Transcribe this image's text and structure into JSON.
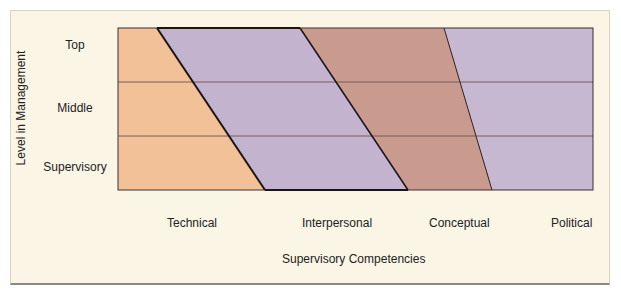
{
  "diagram": {
    "y_axis_label": "Level in Management",
    "x_axis_label": "Supervisory Competencies",
    "levels": [
      "Top",
      "Middle",
      "Supervisory"
    ],
    "competencies": [
      "Technical",
      "Interpersonal",
      "Conceptual",
      "Political"
    ],
    "colors": {
      "background": "#fbf5e6",
      "technical": "#f2c197",
      "interpersonal": "#c4b3cf",
      "conceptual": "#c99a8e",
      "political": "#c7b8d2",
      "lines": "#2a2222"
    },
    "bands": [
      {
        "name": "Technical",
        "top_fraction": 0.08,
        "bottom_fraction": 0.31
      },
      {
        "name": "Interpersonal",
        "top_fraction": 0.38,
        "bottom_fraction": 0.61
      },
      {
        "name": "Conceptual",
        "top_fraction": 0.68,
        "bottom_fraction": 0.79
      },
      {
        "name": "Political",
        "top_fraction": 1.0,
        "bottom_fraction": 1.0
      }
    ]
  }
}
